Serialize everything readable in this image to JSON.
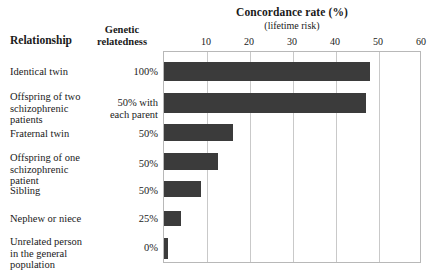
{
  "headers": {
    "relationship": "Relationship",
    "genetic_relatedness": "Genetic\nrelatedness",
    "genetic_line1": "Genetic",
    "genetic_line2": "relatedness"
  },
  "chart_data": {
    "type": "bar",
    "orientation": "horizontal",
    "title": "Concordance rate (%)",
    "subtitle": "(lifetime risk)",
    "xlabel": "Concordance rate (%)",
    "ylabel": "Relationship",
    "xlim": [
      0,
      60
    ],
    "xticks": [
      10,
      20,
      30,
      40,
      50,
      60
    ],
    "xtick_labels": [
      "10",
      "20",
      "30",
      "40",
      "50",
      "60"
    ],
    "grid": true,
    "legend": "none",
    "bar_color": "#3b3b3b",
    "categories": [
      "Identical twin",
      "Offspring of two schizophrenic patients",
      "Fraternal twin",
      "Offspring of one schizophrenic patient",
      "Sibling",
      "Nephew or niece",
      "Unrelated person in the general population"
    ],
    "values": [
      48,
      47,
      16,
      12.5,
      8.5,
      4,
      1
    ],
    "annotations": [
      "100%",
      "50% with each parent",
      "50%",
      "50%",
      "50%",
      "25%",
      "0%"
    ]
  },
  "rows": [
    {
      "label_lines": [
        "Identical twin"
      ],
      "relatedness_lines": [
        "100%"
      ],
      "value": 48
    },
    {
      "label_lines": [
        "Offspring of two",
        "schizophrenic",
        "patients"
      ],
      "relatedness_lines": [
        "50% with",
        "each parent"
      ],
      "value": 47
    },
    {
      "label_lines": [
        "Fraternal twin"
      ],
      "relatedness_lines": [
        "50%"
      ],
      "value": 16
    },
    {
      "label_lines": [
        "Offspring of one",
        "schizophrenic",
        "patient"
      ],
      "relatedness_lines": [
        "50%"
      ],
      "value": 12.5
    },
    {
      "label_lines": [
        "Sibling"
      ],
      "relatedness_lines": [
        "50%"
      ],
      "value": 8.5
    },
    {
      "label_lines": [
        "Nephew or niece"
      ],
      "relatedness_lines": [
        "25%"
      ],
      "value": 4
    },
    {
      "label_lines": [
        "Unrelated person",
        "in the general",
        "population"
      ],
      "relatedness_lines": [
        "0%"
      ],
      "value": 1
    }
  ]
}
